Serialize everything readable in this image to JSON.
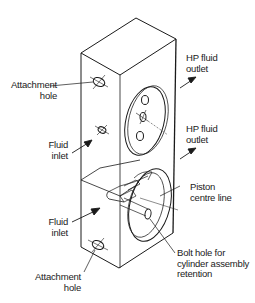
{
  "diagram": {
    "labels": {
      "attachment_hole_top": {
        "line1": "Attachment",
        "line2": "hole"
      },
      "fluid_inlet_top": {
        "line1": "Fluid",
        "line2": "inlet"
      },
      "fluid_inlet_bottom": {
        "line1": "Fluid",
        "line2": "inlet"
      },
      "attachment_hole_bottom": {
        "line1": "Attachment",
        "line2": "hole"
      },
      "hp_outlet_top": {
        "line1": "HP fluid",
        "line2": "outlet"
      },
      "hp_outlet_bottom": {
        "line1": "HP fluid",
        "line2": "outlet"
      },
      "piston_centre_line": {
        "line1": "Piston",
        "line2": "centre line"
      },
      "bolt_hole": {
        "line1": "Bolt hole for",
        "line2": "cylinder assembly",
        "line3": "retention"
      }
    },
    "colors": {
      "line": "#1a1a1a",
      "background": "#ffffff"
    }
  }
}
